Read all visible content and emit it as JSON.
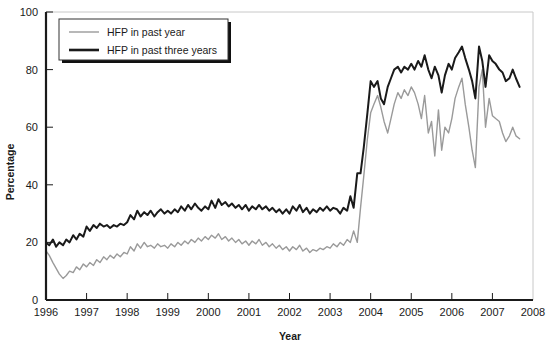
{
  "chart_data": {
    "type": "line",
    "title": "",
    "xlabel": "Year",
    "ylabel": "Percentage",
    "xlim": [
      1996,
      2008
    ],
    "ylim": [
      0,
      100
    ],
    "xticks": [
      "1996",
      "1997",
      "1998",
      "1999",
      "2000",
      "2001",
      "2002",
      "2003",
      "2004",
      "2005",
      "2006",
      "2007",
      "2008"
    ],
    "yticks": [
      "0",
      "20",
      "40",
      "60",
      "80",
      "100"
    ],
    "grid": false,
    "legend_position": "top-left",
    "colors": {
      "hfp_past_year": "#9a9a9a",
      "hfp_past_three_years": "#1a1a1a",
      "axis": "#1a1a1a",
      "frame": "#c8c8c8",
      "background": "#ffffff"
    },
    "series": [
      {
        "name": "HFP in past year",
        "color": "#9a9a9a",
        "linewidth": 1.4,
        "x": [
          1996.0,
          1996.08,
          1996.17,
          1996.25,
          1996.33,
          1996.42,
          1996.5,
          1996.58,
          1996.67,
          1996.75,
          1996.83,
          1996.92,
          1997.0,
          1997.08,
          1997.17,
          1997.25,
          1997.33,
          1997.42,
          1997.5,
          1997.58,
          1997.67,
          1997.75,
          1997.83,
          1997.92,
          1998.0,
          1998.08,
          1998.17,
          1998.25,
          1998.33,
          1998.42,
          1998.5,
          1998.58,
          1998.67,
          1998.75,
          1998.83,
          1998.92,
          1999.0,
          1999.08,
          1999.17,
          1999.25,
          1999.33,
          1999.42,
          1999.5,
          1999.58,
          1999.67,
          1999.75,
          1999.83,
          1999.92,
          2000.0,
          2000.08,
          2000.17,
          2000.25,
          2000.33,
          2000.42,
          2000.5,
          2000.58,
          2000.67,
          2000.75,
          2000.83,
          2000.92,
          2001.0,
          2001.08,
          2001.17,
          2001.25,
          2001.33,
          2001.42,
          2001.5,
          2001.58,
          2001.67,
          2001.75,
          2001.83,
          2001.92,
          2002.0,
          2002.08,
          2002.17,
          2002.25,
          2002.33,
          2002.42,
          2002.5,
          2002.58,
          2002.67,
          2002.75,
          2002.83,
          2002.92,
          2003.0,
          2003.08,
          2003.17,
          2003.25,
          2003.33,
          2003.42,
          2003.5,
          2003.58,
          2003.67,
          2003.75,
          2003.83,
          2003.92,
          2004.0,
          2004.08,
          2004.17,
          2004.25,
          2004.33,
          2004.42,
          2004.5,
          2004.58,
          2004.67,
          2004.75,
          2004.83,
          2004.92,
          2005.0,
          2005.08,
          2005.17,
          2005.25,
          2005.33,
          2005.42,
          2005.5,
          2005.58,
          2005.67,
          2005.75,
          2005.83,
          2005.92,
          2006.0,
          2006.08,
          2006.17,
          2006.25,
          2006.33,
          2006.42,
          2006.5,
          2006.58,
          2006.67,
          2006.75,
          2006.83,
          2006.92,
          2007.0,
          2007.08,
          2007.17,
          2007.25,
          2007.33,
          2007.42,
          2007.5,
          2007.58,
          2007.67
        ],
        "values": [
          17.0,
          15.5,
          13.0,
          11.0,
          9.0,
          7.5,
          8.5,
          10.0,
          9.5,
          11.5,
          10.5,
          12.5,
          11.5,
          13.0,
          12.0,
          14.0,
          13.0,
          15.0,
          14.0,
          15.5,
          14.5,
          16.0,
          15.0,
          16.5,
          16.0,
          18.5,
          17.0,
          19.5,
          18.0,
          20.0,
          18.5,
          19.0,
          18.0,
          19.5,
          18.5,
          19.0,
          18.0,
          19.5,
          18.5,
          20.0,
          19.0,
          20.5,
          19.5,
          21.0,
          20.0,
          21.5,
          20.5,
          22.0,
          21.0,
          22.5,
          21.5,
          23.0,
          21.0,
          22.0,
          20.5,
          21.5,
          20.0,
          21.0,
          19.5,
          20.5,
          19.0,
          20.5,
          19.5,
          21.0,
          19.0,
          20.0,
          18.5,
          19.5,
          18.0,
          19.0,
          17.5,
          18.5,
          17.0,
          18.5,
          17.5,
          19.0,
          17.0,
          18.0,
          16.5,
          17.5,
          17.0,
          18.0,
          17.5,
          18.5,
          18.0,
          19.5,
          18.5,
          20.0,
          19.0,
          21.0,
          20.0,
          24.0,
          20.0,
          32.0,
          43.0,
          56.0,
          65.0,
          68.0,
          71.0,
          67.0,
          62.0,
          58.0,
          63.0,
          68.0,
          72.0,
          70.0,
          73.0,
          71.0,
          74.0,
          72.0,
          68.0,
          63.0,
          71.0,
          58.0,
          62.0,
          50.0,
          66.0,
          52.0,
          60.0,
          58.0,
          63.0,
          70.0,
          74.0,
          77.0,
          68.0,
          60.0,
          52.0,
          46.0,
          74.0,
          80.0,
          60.0,
          70.0,
          64.0,
          63.0,
          62.0,
          58.0,
          55.0,
          57.0,
          60.0,
          57.0,
          56.0
        ]
      },
      {
        "name": "HFP in past three years",
        "color": "#1a1a1a",
        "linewidth": 2.0,
        "x": [
          1996.0,
          1996.08,
          1996.17,
          1996.25,
          1996.33,
          1996.42,
          1996.5,
          1996.58,
          1996.67,
          1996.75,
          1996.83,
          1996.92,
          1997.0,
          1997.08,
          1997.17,
          1997.25,
          1997.33,
          1997.42,
          1997.5,
          1997.58,
          1997.67,
          1997.75,
          1997.83,
          1997.92,
          1998.0,
          1998.08,
          1998.17,
          1998.25,
          1998.33,
          1998.42,
          1998.5,
          1998.58,
          1998.67,
          1998.75,
          1998.83,
          1998.92,
          1999.0,
          1999.08,
          1999.17,
          1999.25,
          1999.33,
          1999.42,
          1999.5,
          1999.58,
          1999.67,
          1999.75,
          1999.83,
          1999.92,
          2000.0,
          2000.08,
          2000.17,
          2000.25,
          2000.33,
          2000.42,
          2000.5,
          2000.58,
          2000.67,
          2000.75,
          2000.83,
          2000.92,
          2001.0,
          2001.08,
          2001.17,
          2001.25,
          2001.33,
          2001.42,
          2001.5,
          2001.58,
          2001.67,
          2001.75,
          2001.83,
          2001.92,
          2002.0,
          2002.08,
          2002.17,
          2002.25,
          2002.33,
          2002.42,
          2002.5,
          2002.58,
          2002.67,
          2002.75,
          2002.83,
          2002.92,
          2003.0,
          2003.08,
          2003.17,
          2003.25,
          2003.33,
          2003.42,
          2003.5,
          2003.58,
          2003.67,
          2003.75,
          2003.83,
          2003.92,
          2004.0,
          2004.08,
          2004.17,
          2004.25,
          2004.33,
          2004.42,
          2004.5,
          2004.58,
          2004.67,
          2004.75,
          2004.83,
          2004.92,
          2005.0,
          2005.08,
          2005.17,
          2005.25,
          2005.33,
          2005.42,
          2005.5,
          2005.58,
          2005.67,
          2005.75,
          2005.83,
          2005.92,
          2006.0,
          2006.08,
          2006.17,
          2006.25,
          2006.33,
          2006.42,
          2006.5,
          2006.58,
          2006.67,
          2006.75,
          2006.83,
          2006.92,
          2007.0,
          2007.08,
          2007.17,
          2007.25,
          2007.33,
          2007.42,
          2007.5,
          2007.58,
          2007.67
        ],
        "values": [
          20.0,
          19.0,
          21.0,
          18.5,
          20.0,
          19.0,
          21.0,
          20.0,
          22.5,
          21.0,
          23.0,
          22.0,
          25.5,
          24.0,
          26.0,
          25.0,
          26.5,
          25.5,
          26.0,
          25.0,
          26.0,
          25.5,
          26.5,
          26.0,
          27.0,
          29.5,
          28.0,
          31.0,
          29.0,
          30.5,
          29.5,
          31.0,
          29.0,
          30.5,
          31.5,
          30.0,
          31.0,
          30.0,
          31.5,
          30.5,
          32.5,
          31.0,
          33.0,
          31.5,
          33.5,
          32.0,
          31.0,
          32.5,
          31.5,
          34.5,
          32.0,
          35.0,
          33.0,
          34.0,
          32.5,
          33.5,
          32.0,
          33.0,
          31.5,
          33.0,
          31.0,
          32.5,
          31.5,
          33.0,
          31.5,
          32.5,
          31.0,
          32.0,
          30.5,
          31.5,
          30.0,
          31.5,
          30.0,
          32.5,
          31.0,
          33.0,
          30.5,
          32.0,
          30.0,
          31.5,
          30.5,
          32.0,
          31.0,
          32.5,
          31.0,
          32.0,
          31.5,
          30.0,
          32.0,
          31.0,
          36.0,
          32.0,
          44.0,
          44.0,
          53.0,
          65.0,
          76.0,
          74.0,
          76.0,
          70.0,
          68.0,
          74.0,
          77.0,
          80.0,
          81.0,
          79.0,
          81.0,
          80.0,
          82.0,
          80.0,
          83.0,
          81.0,
          85.0,
          80.0,
          77.0,
          81.0,
          78.0,
          72.0,
          78.0,
          82.0,
          80.0,
          84.0,
          86.0,
          88.0,
          84.0,
          80.0,
          76.0,
          70.0,
          88.0,
          83.0,
          74.0,
          85.0,
          83.0,
          82.0,
          80.0,
          79.0,
          76.0,
          77.0,
          80.0,
          77.0,
          74.0
        ]
      }
    ],
    "legend": [
      {
        "label": "HFP in past year",
        "color": "#9a9a9a",
        "linewidth": 1.4
      },
      {
        "label": "HFP in past three years",
        "color": "#1a1a1a",
        "linewidth": 2.6
      }
    ]
  }
}
